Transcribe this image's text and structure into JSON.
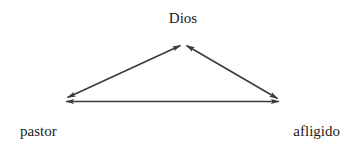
{
  "diagram": {
    "type": "triangle-relationship",
    "background_color": "#ffffff",
    "line_color": "#3a3a3a",
    "text_color": "#1a1a1a",
    "nodes": [
      {
        "id": "dios",
        "label": "Dios",
        "position": "top-center"
      },
      {
        "id": "pastor",
        "label": "pastor",
        "position": "bottom-left"
      },
      {
        "id": "afligido",
        "label": "afligido",
        "position": "bottom-right"
      }
    ],
    "edges": [
      {
        "id": "pastor-dios",
        "from": "pastor",
        "to": "dios",
        "style": "double-arrow"
      },
      {
        "id": "dios-afligido",
        "from": "dios",
        "to": "afligido",
        "style": "double-arrow"
      },
      {
        "id": "pastor-afligido",
        "from": "pastor",
        "to": "afligido",
        "style": "double-arrow"
      }
    ]
  }
}
